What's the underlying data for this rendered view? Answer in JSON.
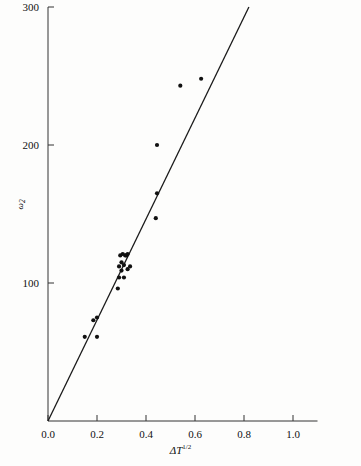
{
  "chart_data": {
    "type": "scatter",
    "title": "",
    "xlabel": "ΔT",
    "xlabel_sup": "1/2",
    "ylabel": "ω",
    "ylabel_sub": "2",
    "xlim": [
      0.0,
      1.1
    ],
    "ylim": [
      0,
      310
    ],
    "grid": false,
    "legend": false,
    "xticks": [
      0.0,
      0.2,
      0.4,
      0.6,
      0.8,
      1.0
    ],
    "xticklabels": [
      "0.0",
      "0.2",
      "0.4",
      "0.6",
      "0.8",
      "1.0"
    ],
    "yticks": [
      100,
      200,
      300
    ],
    "yticklabels": [
      "100",
      "200",
      "300"
    ],
    "marker_color": "#111111",
    "line_color": "#1a1a1a",
    "axis_color": "#333333",
    "points": [
      {
        "x": 0.15,
        "y": 61
      },
      {
        "x": 0.185,
        "y": 73
      },
      {
        "x": 0.2,
        "y": 75
      },
      {
        "x": 0.2,
        "y": 61
      },
      {
        "x": 0.285,
        "y": 96
      },
      {
        "x": 0.29,
        "y": 104
      },
      {
        "x": 0.29,
        "y": 112
      },
      {
        "x": 0.295,
        "y": 120
      },
      {
        "x": 0.3,
        "y": 109
      },
      {
        "x": 0.3,
        "y": 115
      },
      {
        "x": 0.305,
        "y": 121
      },
      {
        "x": 0.31,
        "y": 113
      },
      {
        "x": 0.315,
        "y": 120
      },
      {
        "x": 0.32,
        "y": 120
      },
      {
        "x": 0.325,
        "y": 121
      },
      {
        "x": 0.325,
        "y": 110
      },
      {
        "x": 0.335,
        "y": 112
      },
      {
        "x": 0.31,
        "y": 104
      },
      {
        "x": 0.44,
        "y": 147
      },
      {
        "x": 0.445,
        "y": 165
      },
      {
        "x": 0.445,
        "y": 200
      },
      {
        "x": 0.54,
        "y": 243
      },
      {
        "x": 0.625,
        "y": 248
      }
    ],
    "fit_line": {
      "type": "linear",
      "intercept": 0,
      "slope": 366,
      "x_start": 0.0,
      "y_start": 0,
      "x_end": 0.82,
      "y_end": 300
    }
  },
  "figure": {
    "background": "#fdfdfc"
  }
}
